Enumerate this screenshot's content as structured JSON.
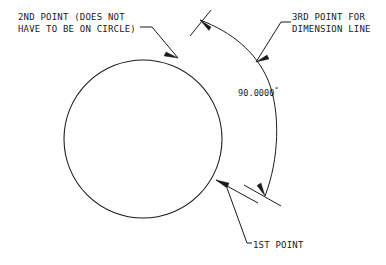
{
  "drawing": {
    "title_text_color": "#1a1a1a",
    "background_color": "#ffffff",
    "labels": {
      "second_point_line1": "2ND POINT (DOES NOT",
      "second_point_line2": "HAVE TO BE ON CIRCLE)",
      "third_point_line1": "3RD POINT FOR",
      "third_point_line2": "DIMENSION LINE",
      "first_point": "1ST POINT",
      "angle_value": "90.0000",
      "angle_unit_symbol": "°"
    },
    "geometry": {
      "circle": {
        "cx": 143,
        "cy": 139,
        "r": 79
      },
      "angle_degrees": 90,
      "dimension_arc_radius": 126
    }
  }
}
